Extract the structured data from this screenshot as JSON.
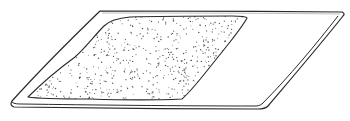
{
  "illustration": {
    "subject": "flat board with spread layer of stippled material",
    "colors": {
      "background": "#ffffff",
      "line": "#2a2a2a",
      "stipple": "#555555"
    },
    "dot_count": 900
  }
}
